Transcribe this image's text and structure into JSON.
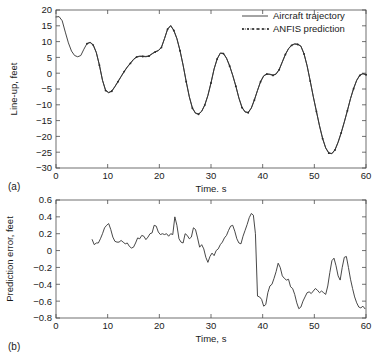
{
  "figure": {
    "panel_a_label": "(a)",
    "panel_b_label": "(b)"
  },
  "legend": {
    "position": "top-right",
    "items": [
      {
        "label": "Aircraft trajectory",
        "style": "solid-line"
      },
      {
        "label": "ANFIS prediction",
        "style": "dotted-line-with-markers"
      }
    ]
  },
  "chart_data": [
    {
      "type": "line",
      "panel": "(a)",
      "title": "",
      "xlabel": "Time, s",
      "ylabel": "Line-up, feet",
      "xlim": [
        0,
        60
      ],
      "ylim": [
        -30,
        20
      ],
      "xticks": [
        0,
        10,
        20,
        30,
        40,
        50,
        60
      ],
      "yticks": [
        20,
        15,
        10,
        5,
        0,
        -5,
        -10,
        -15,
        -20,
        -25,
        -30
      ],
      "grid": false,
      "legend": [
        "Aircraft trajectory",
        "ANFIS prediction"
      ],
      "series": [
        {
          "name": "Aircraft trajectory",
          "style": "solid",
          "x": [
            0.0,
            0.6,
            1.2,
            1.8,
            2.4,
            3.0,
            3.6,
            4.2,
            4.8,
            5.4,
            6.0,
            6.6,
            7.2,
            7.8,
            8.4,
            9.0,
            9.6,
            10.2,
            10.8,
            11.4,
            12.0,
            12.6,
            13.2,
            13.8,
            14.4,
            15.0,
            15.6,
            16.2,
            16.8,
            17.4,
            18.0,
            18.6,
            19.2,
            19.8,
            20.4,
            21.0,
            21.6,
            22.2,
            22.8,
            23.4,
            24.0,
            24.6,
            25.2,
            25.8,
            26.4,
            27.0,
            27.6,
            28.2,
            28.8,
            29.4,
            30.0,
            30.6,
            31.2,
            31.8,
            32.4,
            33.0,
            33.6,
            34.2,
            34.8,
            35.4,
            36.0,
            36.6,
            37.2,
            37.8,
            38.4,
            39.0,
            39.6,
            40.2,
            40.8,
            41.4,
            42.0,
            42.6,
            43.2,
            43.8,
            44.4,
            45.0,
            45.6,
            46.2,
            46.8,
            47.4,
            48.0,
            48.6,
            49.2,
            49.8,
            50.4,
            51.0,
            51.6,
            52.2,
            52.8,
            53.4,
            54.0,
            54.6,
            55.2,
            55.8,
            56.4,
            57.0,
            57.6,
            58.2,
            58.8,
            59.4,
            60.0
          ],
          "y": [
            17.8,
            17.9,
            16.6,
            13.0,
            9.6,
            7.0,
            5.6,
            5.2,
            5.6,
            7.6,
            9.4,
            9.8,
            9.0,
            6.6,
            2.6,
            -2.2,
            -5.4,
            -6.1,
            -5.6,
            -4.2,
            -2.6,
            -1.0,
            0.6,
            2.0,
            3.2,
            4.4,
            5.2,
            5.4,
            5.4,
            5.3,
            5.5,
            6.2,
            6.8,
            7.2,
            8.2,
            11.0,
            14.0,
            15.1,
            13.6,
            11.0,
            7.2,
            2.6,
            -2.6,
            -7.4,
            -11.0,
            -12.6,
            -12.9,
            -12.0,
            -10.0,
            -7.0,
            -3.0,
            1.4,
            4.6,
            6.4,
            6.3,
            4.8,
            2.4,
            -0.6,
            -4.0,
            -7.8,
            -10.8,
            -12.2,
            -12.4,
            -11.0,
            -8.4,
            -5.4,
            -2.6,
            -0.8,
            -0.2,
            -0.3,
            -0.6,
            -0.2,
            1.2,
            3.6,
            6.0,
            7.8,
            8.9,
            9.3,
            9.2,
            8.6,
            6.2,
            2.4,
            -2.4,
            -7.4,
            -12.0,
            -16.6,
            -20.6,
            -23.6,
            -25.2,
            -25.4,
            -24.2,
            -21.8,
            -18.8,
            -15.4,
            -11.8,
            -8.0,
            -4.8,
            -2.2,
            -0.6,
            -0.1,
            -0.4
          ]
        },
        {
          "name": "ANFIS prediction",
          "style": "dotted-markers",
          "x": [
            6.0,
            6.6,
            7.2,
            7.8,
            8.4,
            9.0,
            9.6,
            10.2,
            10.8,
            11.4,
            12.0,
            12.6,
            13.2,
            13.8,
            14.4,
            15.0,
            15.6,
            16.2,
            16.8,
            17.4,
            18.0,
            18.6,
            19.2,
            19.8,
            20.4,
            21.0,
            21.6,
            22.2,
            22.8,
            23.4,
            24.0,
            24.6,
            25.2,
            25.8,
            26.4,
            27.0,
            27.6,
            28.2,
            28.8,
            29.4,
            30.0,
            30.6,
            31.2,
            31.8,
            32.4,
            33.0,
            33.6,
            34.2,
            34.8,
            35.4,
            36.0,
            36.6,
            37.2,
            37.8,
            38.4,
            39.0,
            39.6,
            40.2,
            40.8,
            41.4,
            42.0,
            42.6,
            43.2,
            43.8,
            44.4,
            45.0,
            45.6,
            46.2,
            46.8,
            47.4,
            48.0,
            48.6,
            49.2,
            49.8,
            50.4,
            51.0,
            51.6,
            52.2,
            52.8,
            53.4,
            54.0,
            54.6,
            55.2,
            55.8,
            56.4,
            57.0,
            57.6,
            58.2,
            58.8,
            59.4,
            60.0
          ],
          "y": [
            9.3,
            9.7,
            8.9,
            6.5,
            2.5,
            -2.3,
            -5.5,
            -6.2,
            -5.7,
            -4.3,
            -2.7,
            -1.1,
            0.5,
            1.9,
            3.1,
            4.3,
            5.1,
            5.3,
            5.3,
            5.2,
            5.4,
            6.1,
            6.7,
            7.1,
            8.1,
            10.9,
            13.9,
            15.0,
            13.5,
            10.9,
            7.1,
            2.5,
            -2.7,
            -7.5,
            -11.1,
            -12.7,
            -13.0,
            -12.1,
            -10.1,
            -7.1,
            -3.1,
            1.3,
            4.5,
            6.3,
            6.2,
            4.7,
            2.3,
            -0.7,
            -4.1,
            -7.9,
            -10.9,
            -12.3,
            -12.5,
            -11.1,
            -8.5,
            -5.5,
            -2.7,
            -0.9,
            -0.3,
            -0.4,
            -0.7,
            -0.3,
            1.1,
            3.5,
            5.9,
            7.7,
            8.8,
            9.2,
            9.1,
            8.5,
            6.1,
            2.3,
            -2.5,
            -7.5,
            -12.1,
            -16.7,
            -20.7,
            -23.7,
            -25.3,
            -25.5,
            -24.3,
            -21.9,
            -18.9,
            -15.5,
            -11.9,
            -8.1,
            -4.9,
            -2.3,
            -0.7,
            -0.2,
            -0.5
          ]
        }
      ]
    },
    {
      "type": "line",
      "panel": "(b)",
      "title": "",
      "xlabel": "Time, s",
      "ylabel": "Prediction error, feet",
      "xlim": [
        0,
        60
      ],
      "ylim": [
        -0.8,
        0.6
      ],
      "xticks": [
        0,
        10,
        20,
        30,
        40,
        50,
        60
      ],
      "yticks": [
        0.6,
        0.4,
        0.2,
        0,
        -0.2,
        -0.4,
        -0.6,
        -0.8
      ],
      "grid": false,
      "series": [
        {
          "name": "Prediction error",
          "style": "solid",
          "x": [
            7.0,
            7.4,
            7.8,
            8.2,
            8.6,
            9.0,
            9.4,
            9.8,
            10.2,
            10.6,
            11.0,
            11.4,
            11.8,
            12.2,
            12.6,
            13.0,
            13.4,
            13.8,
            14.2,
            14.6,
            15.0,
            15.4,
            15.8,
            16.2,
            16.6,
            17.0,
            17.4,
            17.8,
            18.2,
            18.6,
            19.0,
            19.4,
            19.8,
            20.2,
            20.6,
            21.0,
            21.4,
            21.8,
            22.2,
            22.6,
            23.0,
            23.4,
            23.8,
            24.2,
            24.6,
            25.0,
            25.4,
            25.8,
            26.2,
            26.6,
            27.0,
            27.4,
            27.8,
            28.2,
            28.6,
            29.0,
            29.4,
            29.8,
            30.2,
            30.6,
            31.0,
            31.4,
            31.8,
            32.2,
            32.6,
            33.0,
            33.4,
            33.8,
            34.2,
            34.6,
            35.0,
            35.4,
            35.8,
            36.2,
            36.6,
            37.0,
            37.4,
            37.8,
            38.2,
            38.6,
            39.0,
            39.4,
            39.8,
            40.2,
            40.6,
            41.0,
            41.4,
            41.8,
            42.2,
            42.6,
            43.0,
            43.4,
            43.8,
            44.2,
            44.6,
            45.0,
            45.4,
            45.8,
            46.2,
            46.6,
            47.0,
            47.4,
            47.8,
            48.2,
            48.6,
            49.0,
            49.4,
            49.8,
            50.2,
            50.6,
            51.0,
            51.4,
            51.8,
            52.2,
            52.6,
            53.0,
            53.4,
            53.8,
            54.2,
            54.6,
            55.0,
            55.4,
            55.8,
            56.2,
            56.6,
            57.0,
            57.4,
            57.8,
            58.2,
            58.6,
            59.0,
            59.4,
            59.8,
            60.0
          ],
          "y": [
            0.13,
            0.07,
            0.09,
            0.09,
            0.14,
            0.2,
            0.27,
            0.3,
            0.32,
            0.25,
            0.16,
            0.11,
            0.1,
            0.1,
            0.12,
            0.1,
            0.08,
            0.09,
            0.05,
            0.03,
            0.04,
            0.09,
            0.15,
            0.14,
            0.18,
            0.17,
            0.13,
            0.16,
            0.2,
            0.21,
            0.3,
            0.29,
            0.22,
            0.19,
            0.2,
            0.19,
            0.2,
            0.17,
            0.2,
            0.19,
            0.4,
            0.3,
            0.14,
            0.1,
            0.09,
            0.2,
            0.18,
            0.14,
            0.16,
            0.27,
            0.25,
            0.15,
            0.04,
            0.07,
            0.02,
            -0.08,
            -0.14,
            -0.07,
            -0.03,
            -0.06,
            0.0,
            0.02,
            0.07,
            0.1,
            0.15,
            0.18,
            0.24,
            0.29,
            0.3,
            0.23,
            0.14,
            0.09,
            0.08,
            0.17,
            0.24,
            0.31,
            0.39,
            0.44,
            0.42,
            0.2,
            -0.54,
            -0.55,
            -0.58,
            -0.66,
            -0.64,
            -0.5,
            -0.42,
            -0.4,
            -0.33,
            -0.25,
            -0.15,
            -0.2,
            -0.3,
            -0.33,
            -0.35,
            -0.34,
            -0.43,
            -0.45,
            -0.52,
            -0.62,
            -0.69,
            -0.67,
            -0.6,
            -0.55,
            -0.5,
            -0.49,
            -0.51,
            -0.48,
            -0.45,
            -0.47,
            -0.5,
            -0.48,
            -0.5,
            -0.52,
            -0.42,
            -0.26,
            -0.12,
            -0.09,
            -0.18,
            -0.3,
            -0.35,
            -0.2,
            -0.08,
            -0.07,
            -0.2,
            -0.34,
            -0.45,
            -0.55,
            -0.62,
            -0.67,
            -0.68,
            -0.66,
            -0.69
          ]
        }
      ]
    }
  ]
}
